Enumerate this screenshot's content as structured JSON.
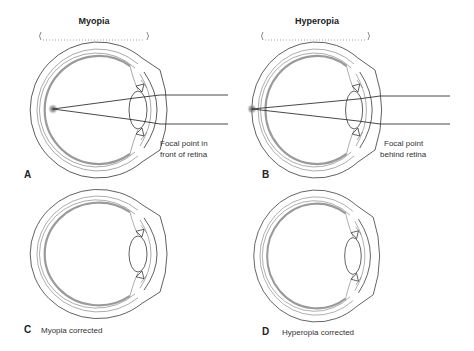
{
  "diagram": {
    "panels": [
      {
        "id": "A",
        "title": "Myopia",
        "caption_lines": [
          "Focal point in",
          "front of retina"
        ],
        "label": "A"
      },
      {
        "id": "B",
        "title": "Hyperopia",
        "caption_lines": [
          "Focal point",
          "behind retina"
        ],
        "label": "B"
      },
      {
        "id": "C",
        "label": "C",
        "caption": "Myopia corrected"
      },
      {
        "id": "D",
        "label": "D",
        "caption": "Hyperopia corrected"
      }
    ]
  },
  "colors": {
    "outline": "#333333",
    "retina": "#9a9a9a",
    "focal_point": "#666666",
    "background": "#ffffff"
  }
}
